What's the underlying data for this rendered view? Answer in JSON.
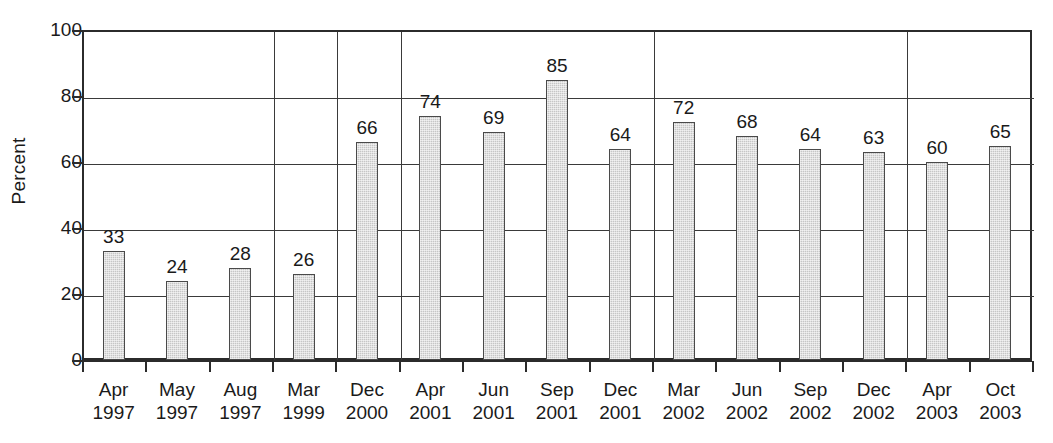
{
  "chart_data": {
    "type": "bar",
    "title": "",
    "subtitle": "",
    "xlabel": "",
    "ylabel": "Percent",
    "ylim": [
      0,
      100
    ],
    "yticks": [
      0,
      20,
      40,
      60,
      80,
      100
    ],
    "grid": "horizontal-and-vertical-group-separators",
    "legend": "none",
    "bar_fill_color": "#c6c6c6",
    "bar_border_color": "#4a4a4a",
    "axis_color": "#2b2b2b",
    "value_labels_shown": true,
    "categories": [
      "Apr 1997",
      "May 1997",
      "Aug 1997",
      "Mar 1999",
      "Dec 2000",
      "Apr 2001",
      "Jun 2001",
      "Sep 2001",
      "Dec 2001",
      "Mar 2002",
      "Jun 2002",
      "Sep 2002",
      "Dec 2002",
      "Apr 2003",
      "Oct 2003"
    ],
    "category_lines": [
      {
        "month": "Apr",
        "year": "1997"
      },
      {
        "month": "May",
        "year": "1997"
      },
      {
        "month": "Aug",
        "year": "1997"
      },
      {
        "month": "Mar",
        "year": "1999"
      },
      {
        "month": "Dec",
        "year": "2000"
      },
      {
        "month": "Apr",
        "year": "2001"
      },
      {
        "month": "Jun",
        "year": "2001"
      },
      {
        "month": "Sep",
        "year": "2001"
      },
      {
        "month": "Dec",
        "year": "2001"
      },
      {
        "month": "Mar",
        "year": "2002"
      },
      {
        "month": "Jun",
        "year": "2002"
      },
      {
        "month": "Sep",
        "year": "2002"
      },
      {
        "month": "Dec",
        "year": "2002"
      },
      {
        "month": "Apr",
        "year": "2003"
      },
      {
        "month": "Oct",
        "year": "2003"
      }
    ],
    "values": [
      33,
      24,
      28,
      26,
      66,
      74,
      69,
      85,
      64,
      72,
      68,
      64,
      63,
      60,
      65
    ],
    "group_separator_after_index": [
      2,
      3,
      4,
      8,
      12
    ]
  }
}
